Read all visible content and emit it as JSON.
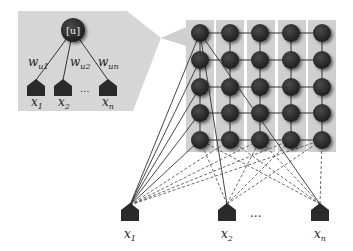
{
  "diagram": {
    "type": "self-organizing-map",
    "inset": {
      "neuron_label": "[u]",
      "weights": [
        {
          "base": "w",
          "sub": "u1"
        },
        {
          "base": "w",
          "sub": "u2"
        },
        {
          "base": "w",
          "sub": "un"
        }
      ],
      "inputs": [
        {
          "base": "x",
          "sub": "1"
        },
        {
          "base": "x",
          "sub": "2"
        },
        {
          "base": "x",
          "sub": "n"
        }
      ],
      "ellipsis": "..."
    },
    "grid": {
      "rows": 5,
      "cols": 5
    },
    "inputs": [
      {
        "base": "x",
        "sub": "1"
      },
      {
        "base": "x",
        "sub": "2"
      },
      {
        "base": "x",
        "sub": "n"
      }
    ],
    "ellipsis": "...",
    "colors": {
      "panel": "#d4d4d4",
      "node": "#2e2e2e",
      "edge": "#333333",
      "input": "#2a2a2a"
    }
  }
}
